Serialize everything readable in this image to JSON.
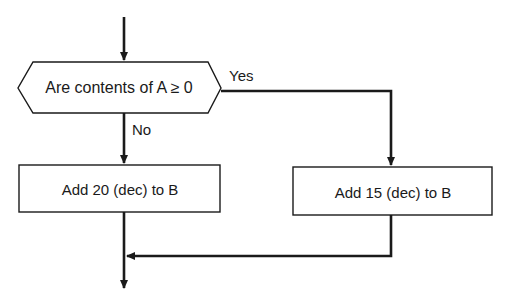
{
  "diagram": {
    "type": "flowchart",
    "colors": {
      "line": "#1a1a1a",
      "background": "#ffffff"
    },
    "decision": {
      "label": "Are contents of A ≥ 0",
      "yes_label": "Yes",
      "no_label": "No"
    },
    "process_no": {
      "label": "Add 20 (dec) to B"
    },
    "process_yes": {
      "label": "Add 15 (dec) to B"
    }
  }
}
